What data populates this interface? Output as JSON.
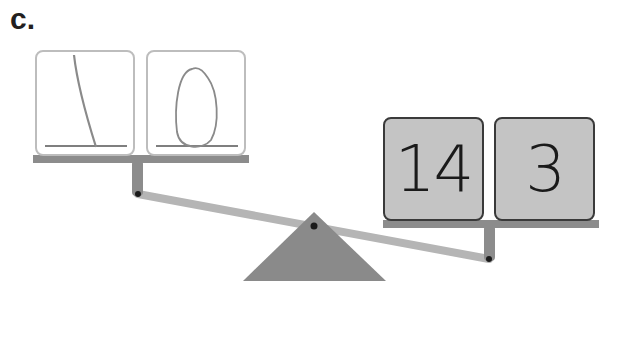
{
  "problem": {
    "label": "c."
  },
  "balance": {
    "tilt": "right side lower (heavier)",
    "colors": {
      "pan": "#8c8c8c",
      "beam": "#b5b5b5",
      "fulcrum": "#8a8a8a",
      "pivot": "#1a1a1a",
      "number_card_fill": "#c4c4c4",
      "write_card_border": "#bdbdbd"
    },
    "left_pan": {
      "cards": [
        {
          "type": "handwritten",
          "value": "1"
        },
        {
          "type": "handwritten",
          "value": "0"
        }
      ],
      "reads_as": "10"
    },
    "right_pan": {
      "cards": [
        {
          "type": "printed",
          "value": "14"
        },
        {
          "type": "printed",
          "value": "3"
        }
      ]
    }
  }
}
